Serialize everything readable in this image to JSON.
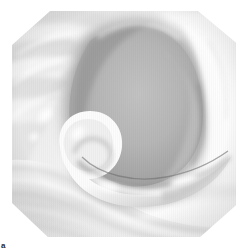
{
  "figure": {
    "panel_label": "a",
    "caption_position": "bottom-left",
    "width_px": 248,
    "height_px": 252,
    "background_color": "#ffffff",
    "medium": "grayscale 3d rendered anatomical illustration",
    "frame": {
      "shape": "octagon",
      "note": "square render with chamfered corners",
      "left_px": 12,
      "top_px": 11,
      "width_px": 224,
      "height_px": 226
    }
  },
  "palette": {
    "paper_white": "#ffffff",
    "highlight_white": "#fbfbfb",
    "light_gray": "#e6e6e6",
    "mid_light_gray": "#d2d2d2",
    "mid_gray": "#bcbcbc",
    "cavity_gray": "#b2b2b2",
    "cavity_shadow": "#9a9a9a",
    "deep_shadow": "#858585",
    "outline_gray": "#6f6f6f",
    "label_ink": "#2b2b2b"
  },
  "scene": {
    "description": "Endoscopic style view of a soft tissue cavity surrounded by concentric folds, with a curved hook shaped structure in the lower left foreground.",
    "regions": [
      {
        "name": "cavity",
        "label": "central dark aperture",
        "fill": "#b2b2b2",
        "edge_shadow": "#8d8d8d"
      },
      {
        "name": "upper-left-folds",
        "label": "concentric tissue folds, upper left",
        "fill": "#e4e4e4",
        "highlight": "#fafafa"
      },
      {
        "name": "right-wall",
        "label": "smooth tissue wall, right",
        "fill": "#f0f0f0",
        "highlight": "#ffffff"
      },
      {
        "name": "hook-structure",
        "label": "curved hook shaped element",
        "fill": "#fdfdfd",
        "shadow": "#a6a6a6"
      },
      {
        "name": "lower-waves",
        "label": "wave shaped floor ridges",
        "fill": "#ececec",
        "shadow": "#c9c9c9"
      }
    ]
  }
}
